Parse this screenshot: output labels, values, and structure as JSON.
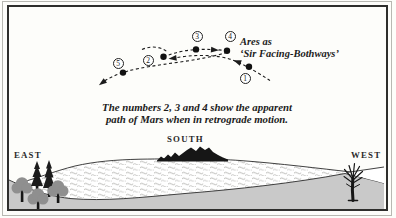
{
  "diagram": {
    "ares_label": {
      "line1": "Ares as",
      "line2": "‘Sir Facing-Bothways’"
    },
    "badges": {
      "b1": "1",
      "b2": "2",
      "b3": "3",
      "b4": "4",
      "b5": "5"
    },
    "caption": {
      "line1": "The numbers 2, 3 and 4 show the apparent",
      "line2": "path of Mars when in retrograde motion."
    },
    "directions": {
      "east": "EAST",
      "south": "SOUTH",
      "west": "WEST"
    },
    "colors": {
      "ink": "#1c1c1c",
      "foreground_gray": "#c9c9c9",
      "tree_gray": "#8f8f8f",
      "silhouette": "#161616",
      "frame": "#2e2e2c"
    }
  }
}
